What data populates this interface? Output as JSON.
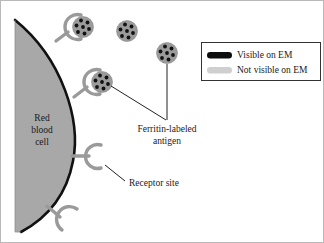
{
  "figure": {
    "type": "biology-schematic"
  },
  "labels": {
    "cell_line1": "Red",
    "cell_line2": "blood",
    "cell_line3": "cell",
    "antigen_line1": "Ferritin-labeled",
    "antigen_line2": "antigen",
    "receptor": "Receptor site"
  },
  "legend": {
    "items": [
      {
        "label": "Visible on EM",
        "swatch_color": "#0d0d0d",
        "swatch_name": "black-pill-swatch"
      },
      {
        "label": "Not visible on EM",
        "swatch_color": "#cfcfcf",
        "swatch_name": "gray-pill-swatch"
      }
    ]
  },
  "colors": {
    "cell_fill": "#a8a8a8",
    "cell_outline": "#111111",
    "receptor": "#9a9a9a",
    "particle_fill": "#9b9b9b",
    "particle_dot": "#111111",
    "leader_line": "#222222",
    "frame_border": "#b9b9b9",
    "legend_border": "#333333"
  },
  "elements": {
    "bound_particles": 2,
    "free_particles": 2,
    "empty_receptors": 2,
    "dots_per_particle": 7
  }
}
